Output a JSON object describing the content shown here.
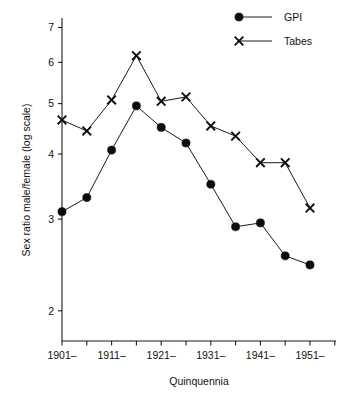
{
  "chart_data": {
    "type": "line",
    "title": "",
    "xlabel": "Quinquennia",
    "ylabel": "Sex ratio male/female (log scale)",
    "yscale": "log",
    "ylim": [
      1.75,
      7.3
    ],
    "ytick_labels": [
      "7",
      "6",
      "5",
      "4",
      "3",
      "2"
    ],
    "ytick_values": [
      7,
      6,
      5,
      4,
      3,
      2
    ],
    "xtick_labels": [
      "1901–",
      "1911–",
      "1921–",
      "1931–",
      "1941–",
      "1951–"
    ],
    "minor_xticks": 12,
    "grid": false,
    "legend_position": "top-right",
    "categories": [
      "1901–",
      "1906–",
      "1911–",
      "1916–",
      "1921–",
      "1926–",
      "1931–",
      "1936–",
      "1941–",
      "1946–",
      "1951–"
    ],
    "series": [
      {
        "name": "GPI",
        "marker": "circle",
        "values": [
          3.1,
          3.3,
          4.07,
          4.95,
          4.5,
          4.2,
          3.5,
          2.9,
          2.95,
          2.55,
          2.45
        ]
      },
      {
        "name": "Tabes",
        "marker": "x",
        "values": [
          4.65,
          4.43,
          5.08,
          6.18,
          5.05,
          5.15,
          4.53,
          4.33,
          3.85,
          3.85,
          3.15
        ]
      }
    ]
  },
  "legend": {
    "items": [
      {
        "label": "GPI",
        "marker": "circle"
      },
      {
        "label": "Tabes",
        "marker": "x"
      }
    ]
  },
  "axes": {
    "y_title": "Sex ratio male/female (log scale)",
    "x_title": "Quinquennia"
  }
}
